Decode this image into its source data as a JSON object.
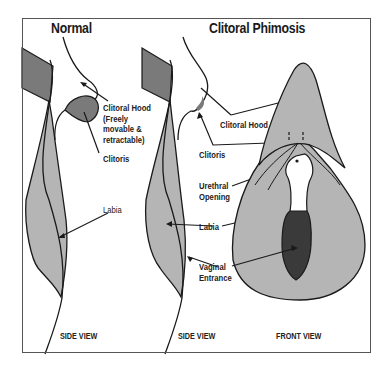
{
  "panels": [
    {
      "title": "Normal",
      "view_label": "SIDE VIEW",
      "labels": {
        "clitoral_hood": [
          "Clitoral Hood",
          "(Freely",
          "movable &",
          "retractable)"
        ],
        "clitoris": "Clitoris",
        "labia": "Labia"
      }
    },
    {
      "title": "Clitoral Phimosis",
      "side_view_label": "SIDE VIEW",
      "front_view_label": "FRONT VIEW",
      "labels": {
        "clitoral_hood": "Clitoral Hood",
        "clitoris": "Clitoris",
        "urethral_opening": [
          "Urethral",
          "Opening"
        ],
        "labia": "Labia",
        "vaginal_entrance": [
          "Vaginal",
          "Entrance"
        ]
      }
    }
  ],
  "colors": {
    "dark_gray": "#7a7a7a",
    "light_gray": "#b5b5b5",
    "darkest": "#3a3a3a",
    "outline": "#1a1a1a",
    "frame": "#555555"
  }
}
